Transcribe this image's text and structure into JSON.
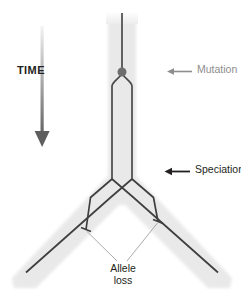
{
  "figure": {
    "width": 241,
    "height": 303
  },
  "labels": {
    "time": "TIME",
    "mutation": "Mutation",
    "speciation": "Speciation",
    "allele_loss_line1": "Allele",
    "allele_loss_line2": "loss"
  },
  "colors": {
    "background": "#ffffff",
    "species_band": "#e8e8e8",
    "species_band_soft": "#f1f1f1",
    "lineage_line": "#4d4d4d",
    "lineage_line_dark": "#3a3a3a",
    "mutation_dot": "#6e6e6e",
    "mutation_text": "#8d8d8d",
    "speciation_text": "#231f20",
    "time_text": "#231f20",
    "arrow_dark": "#5a5a5a",
    "leader_line": "#9a9a9a"
  },
  "diagram": {
    "type": "gene-tree-in-species-tree",
    "time_axis": {
      "direction": "downward",
      "label": "TIME",
      "arrow_x": 42,
      "arrow_top_y": 26,
      "arrow_bottom_y": 146,
      "gradient": "light-to-dark"
    },
    "species_band": {
      "description": "Light gray band representing the population/species, vertical then splitting into a V",
      "stem_x_center": 122,
      "stem_half_width": 14,
      "stem_top_y": 14,
      "split_y": 188,
      "left_tip_x": 12,
      "right_tip_x": 232,
      "tip_y": 288
    },
    "events": [
      {
        "name": "mutation",
        "label": "Mutation",
        "marker": "dot",
        "x": 122,
        "y": 72,
        "radius": 4.4,
        "arrow_from_x": 192,
        "arrow_to_x": 168,
        "arrow_y": 72
      },
      {
        "name": "speciation",
        "label": "Speciation",
        "marker": "branch-point",
        "x": 122,
        "y": 186,
        "arrow_from_x": 190,
        "arrow_to_x": 166,
        "arrow_y": 172
      }
    ],
    "lineages": [
      {
        "name": "ancestral-lineage",
        "points": [
          [
            122,
            13
          ],
          [
            122,
            70
          ]
        ]
      },
      {
        "name": "allele-A-upper",
        "points": [
          [
            122,
            74
          ],
          [
            112,
            84
          ],
          [
            112,
            178
          ]
        ]
      },
      {
        "name": "allele-B-upper",
        "points": [
          [
            122,
            74
          ],
          [
            132,
            84
          ],
          [
            132,
            178
          ]
        ]
      },
      {
        "name": "allele-A-to-right-species",
        "points": [
          [
            112,
            178
          ],
          [
            133,
            196
          ],
          [
            218,
            272
          ]
        ]
      },
      {
        "name": "allele-B-to-left-species",
        "points": [
          [
            132,
            178
          ],
          [
            111,
            196
          ],
          [
            26,
            272
          ]
        ]
      },
      {
        "name": "allele-A-left-species-lost",
        "points": [
          [
            112,
            178
          ],
          [
            91,
            196
          ],
          [
            86,
            230
          ]
        ],
        "terminates": true
      },
      {
        "name": "allele-B-right-species-lost",
        "points": [
          [
            132,
            178
          ],
          [
            153,
            196
          ],
          [
            158,
            222
          ]
        ],
        "terminates": true
      }
    ],
    "allele_loss": {
      "label_line1": "Allele",
      "label_line2": "loss",
      "label_x": 123,
      "label_y": 268,
      "terminators": [
        {
          "x": 86,
          "y": 230,
          "tick": "perpendicular"
        },
        {
          "x": 158,
          "y": 222,
          "tick": "perpendicular"
        }
      ],
      "leader_lines": [
        {
          "from": [
            116,
            261
          ],
          "to": [
            87,
            232
          ]
        },
        {
          "from": [
            128,
            261
          ],
          "to": [
            157,
            224
          ]
        }
      ]
    }
  }
}
